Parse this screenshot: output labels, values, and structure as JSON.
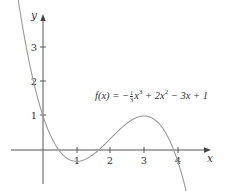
{
  "chart_data": {
    "type": "line",
    "title": "",
    "xlabel": "x",
    "ylabel": "y",
    "xlim": [
      -0.95,
      4.95
    ],
    "ylim": [
      -1.0,
      3.9
    ],
    "x_ticks": [
      1,
      2,
      3,
      4
    ],
    "x_tick_labels": [
      "1",
      "2",
      "3",
      "4"
    ],
    "y_ticks": [
      1,
      2,
      3
    ],
    "y_tick_labels": [
      "1",
      "2",
      "3"
    ],
    "grid": false,
    "legend": null,
    "annotation": "f(x) = −⅓x³ + 2x² − 3x + 1",
    "series": [
      {
        "name": "f(x) = -1/3 x^3 + 2x^2 - 3x + 1",
        "formula": "-x^3/3 + 2*x^2 - 3*x + 1",
        "x_range": [
          -0.9,
          4.35
        ],
        "key_points": [
          {
            "x": 0,
            "y": 1,
            "note": "y-intercept"
          },
          {
            "x": 1,
            "y": -0.333,
            "note": "local minimum"
          },
          {
            "x": 3,
            "y": 1,
            "note": "local maximum"
          },
          {
            "x": 4,
            "y": -0.333
          }
        ]
      }
    ],
    "colors": {
      "axis": "#555555",
      "curve": "#9a9a9a",
      "text": "#333333"
    }
  },
  "labels": {
    "x_axis": "x",
    "y_axis": "y",
    "tick_x_1": "1",
    "tick_x_2": "2",
    "tick_x_3": "3",
    "tick_x_4": "4",
    "tick_y_1": "1",
    "tick_y_2": "2",
    "tick_y_3": "3",
    "formula_lhs": "f(x) = −",
    "formula_num": "1",
    "formula_den": "3",
    "formula_rhs_1": "x",
    "formula_exp_3": "3",
    "formula_rhs_2": " + 2x",
    "formula_exp_2": "2",
    "formula_rhs_3": " − 3x + 1"
  }
}
